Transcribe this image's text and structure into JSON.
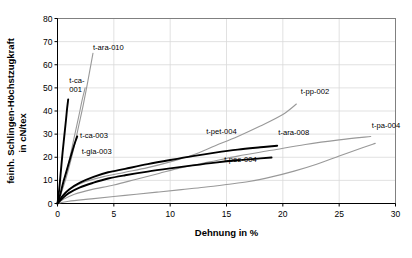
{
  "chart_data": {
    "type": "line",
    "title": "",
    "xlabel": "Dehnung in %",
    "ylabel": "feinh. Schlingen-Höchstzugkraft in cN/tex",
    "ylabel_line1": "feinh. Schlingen-Höchstzugkraft",
    "ylabel_line2": "in cN/tex",
    "xlim": [
      0,
      30
    ],
    "ylim": [
      0,
      80
    ],
    "xticks": [
      "0",
      "5",
      "10",
      "15",
      "20",
      "25",
      "30"
    ],
    "yticks": [
      "0",
      "10",
      "20",
      "30",
      "40",
      "50",
      "60",
      "70",
      "80"
    ],
    "grid": "horizontal-and-vertical-light",
    "legend": "inline-labels",
    "colors": {
      "black": "#000000",
      "gray": "#999999",
      "axis": "#000000",
      "grid": "#d9d9d9"
    },
    "series": [
      {
        "name": "t-ca-001",
        "color": "black",
        "label_x": 1.05,
        "label_y": 52.0,
        "label_anchor": "start",
        "label_lines": [
          "t-ca-",
          "001"
        ],
        "points": [
          [
            0,
            0
          ],
          [
            0.15,
            6
          ],
          [
            0.3,
            14
          ],
          [
            0.45,
            22
          ],
          [
            0.6,
            29
          ],
          [
            0.75,
            36
          ],
          [
            0.85,
            41
          ],
          [
            0.95,
            45
          ]
        ]
      },
      {
        "name": "t-ara-010",
        "color": "gray",
        "label_x": 3.15,
        "label_y": 66.5,
        "label_anchor": "start",
        "label_lines": [
          "t-ara-010"
        ],
        "points": [
          [
            0,
            0
          ],
          [
            0.3,
            4
          ],
          [
            0.7,
            10
          ],
          [
            1.1,
            17
          ],
          [
            1.5,
            25
          ],
          [
            1.9,
            34
          ],
          [
            2.3,
            43
          ],
          [
            2.7,
            53
          ],
          [
            3.0,
            61
          ],
          [
            3.15,
            65
          ]
        ]
      },
      {
        "name": "t-ca-003",
        "color": "black",
        "label_x": 2.0,
        "label_y": 28.5,
        "label_anchor": "start",
        "label_lines": [
          "t-ca-003"
        ],
        "points": [
          [
            0,
            0
          ],
          [
            0.25,
            4
          ],
          [
            0.5,
            9
          ],
          [
            0.8,
            14
          ],
          [
            1.1,
            19
          ],
          [
            1.4,
            24
          ],
          [
            1.6,
            27
          ],
          [
            1.75,
            29
          ]
        ]
      },
      {
        "name": "t-gla-003",
        "color": "gray",
        "label_x": 2.15,
        "label_y": 21.5,
        "label_anchor": "start",
        "label_lines": [
          "t-gla-003"
        ],
        "points": [
          [
            0,
            0
          ],
          [
            0.3,
            5
          ],
          [
            0.7,
            12
          ],
          [
            1.1,
            20
          ],
          [
            1.5,
            29
          ],
          [
            1.9,
            38
          ],
          [
            2.2,
            45
          ],
          [
            2.45,
            50
          ]
        ]
      },
      {
        "name": "t-pet-004",
        "color": "gray",
        "label_x": 13.2,
        "label_y": 30.0,
        "label_anchor": "start",
        "label_lines": [
          "t-pet-004"
        ],
        "points": [
          [
            0,
            0
          ],
          [
            0.5,
            3.5
          ],
          [
            1.2,
            6.5
          ],
          [
            2.5,
            9.5
          ],
          [
            4,
            11.5
          ],
          [
            6,
            13.5
          ],
          [
            8,
            15.5
          ],
          [
            10,
            18
          ],
          [
            12,
            21
          ],
          [
            14,
            25
          ],
          [
            16,
            29
          ],
          [
            18,
            33.5
          ],
          [
            20,
            38.5
          ],
          [
            21.2,
            43
          ]
        ]
      },
      {
        "name": "t-pp-002",
        "color": "gray",
        "label_x": 21.6,
        "label_y": 47.5,
        "label_anchor": "start",
        "label_lines": [
          "t-pp-002"
        ],
        "points": [
          [
            0,
            0
          ],
          [
            0.6,
            2
          ],
          [
            1.5,
            4
          ],
          [
            3,
            6
          ],
          [
            5,
            8
          ],
          [
            7,
            10.5
          ],
          [
            9,
            13
          ],
          [
            11,
            15.5
          ],
          [
            13.5,
            18
          ],
          [
            16,
            20.5
          ],
          [
            19,
            23
          ],
          [
            22,
            25.5
          ],
          [
            25,
            27.5
          ],
          [
            27.8,
            29
          ]
        ]
      },
      {
        "name": "t-ara-008",
        "color": "black",
        "label_x": 19.6,
        "label_y": 29.5,
        "label_anchor": "start",
        "label_lines": [
          "t-ara-008"
        ],
        "points": [
          [
            0,
            0
          ],
          [
            0.4,
            3
          ],
          [
            1,
            6
          ],
          [
            2,
            9
          ],
          [
            3.2,
            11.5
          ],
          [
            4.5,
            13.5
          ],
          [
            6,
            15
          ],
          [
            8,
            17
          ],
          [
            10,
            18.8
          ],
          [
            12,
            20.5
          ],
          [
            14,
            22
          ],
          [
            16,
            23.3
          ],
          [
            18,
            24.3
          ],
          [
            19.5,
            25
          ]
        ]
      },
      {
        "name": "t-pee-004",
        "color": "black",
        "label_x": 14.8,
        "label_y": 18.0,
        "label_anchor": "start",
        "label_lines": [
          "t-pee-004"
        ],
        "points": [
          [
            0,
            0
          ],
          [
            0.4,
            2
          ],
          [
            1,
            4.5
          ],
          [
            2,
            7
          ],
          [
            3.2,
            9
          ],
          [
            4.5,
            10.8
          ],
          [
            6,
            12.2
          ],
          [
            8,
            13.8
          ],
          [
            10,
            15.2
          ],
          [
            12,
            16.5
          ],
          [
            14,
            17.7
          ],
          [
            16,
            18.7
          ],
          [
            18,
            19.5
          ],
          [
            19,
            19.9
          ]
        ]
      },
      {
        "name": "t-pa-004",
        "color": "gray",
        "label_x": 27.9,
        "label_y": 32.5,
        "label_anchor": "start",
        "label_lines": [
          "t-pa-004"
        ],
        "points": [
          [
            0,
            0
          ],
          [
            1,
            1
          ],
          [
            3,
            2
          ],
          [
            5,
            3
          ],
          [
            7,
            4
          ],
          [
            9,
            5
          ],
          [
            11,
            6
          ],
          [
            13,
            7
          ],
          [
            15,
            8.2
          ],
          [
            17,
            9.5
          ],
          [
            19,
            11.5
          ],
          [
            21,
            14
          ],
          [
            23,
            17
          ],
          [
            25,
            20.5
          ],
          [
            27,
            24
          ],
          [
            28.2,
            26
          ]
        ]
      }
    ]
  }
}
